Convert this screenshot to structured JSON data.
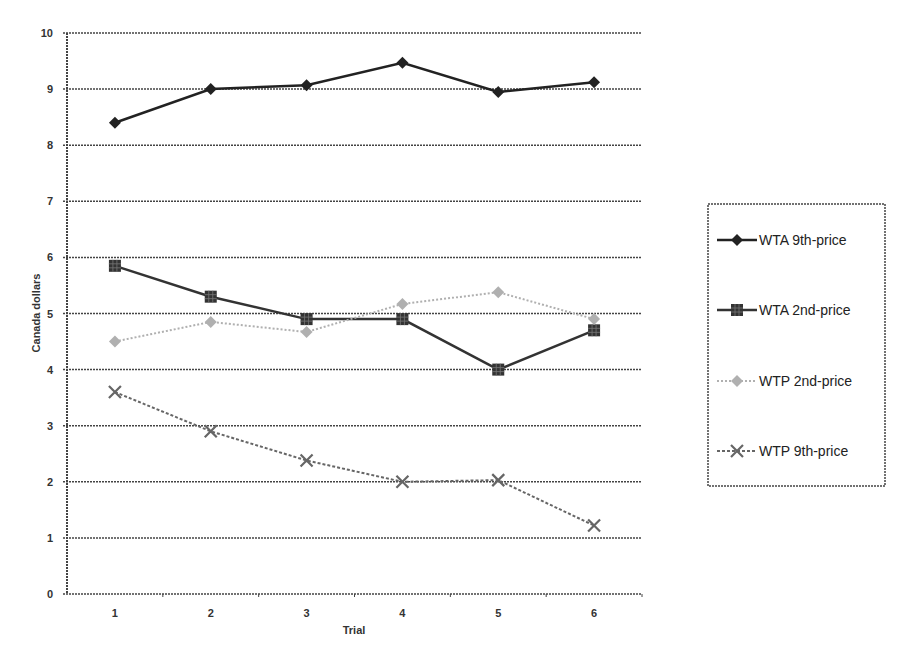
{
  "chart_data": {
    "type": "line",
    "title": "",
    "xlabel": "Trial",
    "ylabel": "Canada dollars",
    "x": [
      "1",
      "2",
      "3",
      "4",
      "5",
      "6"
    ],
    "ylim": [
      0,
      10
    ],
    "yticks": [
      "0",
      "1",
      "2",
      "3",
      "4",
      "5",
      "6",
      "7",
      "8",
      "9",
      "10"
    ],
    "grid": true,
    "legend_position": "right",
    "series": [
      {
        "name": "WTA 9th-price",
        "marker": "diamond",
        "color": "#222222",
        "line": "solid",
        "values": [
          8.4,
          9.0,
          9.07,
          9.47,
          8.95,
          9.12
        ]
      },
      {
        "name": "WTA 2nd-price",
        "marker": "square",
        "color": "#333333",
        "line": "solid",
        "values": [
          5.85,
          5.3,
          4.9,
          4.9,
          4.0,
          4.7
        ]
      },
      {
        "name": "WTP 2nd-price",
        "marker": "diamond",
        "color": "#b0b0b0",
        "line": "dotted",
        "values": [
          4.5,
          4.85,
          4.67,
          5.17,
          5.38,
          4.9
        ]
      },
      {
        "name": "WTP 9th-price",
        "marker": "x",
        "color": "#666666",
        "line": "dashed",
        "values": [
          3.6,
          2.9,
          2.38,
          2.0,
          2.03,
          1.22
        ]
      }
    ]
  }
}
